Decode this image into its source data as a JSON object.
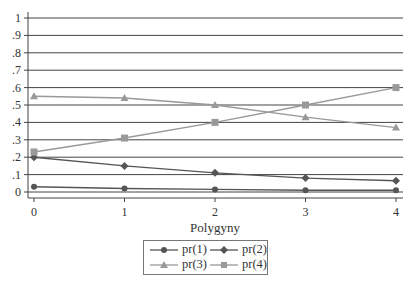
{
  "chart_data": {
    "type": "line",
    "title": "",
    "xlabel": "Polygyny",
    "ylabel": "",
    "x": [
      0,
      1,
      2,
      3,
      4
    ],
    "xticks": [
      "0",
      "1",
      "2",
      "3",
      "4"
    ],
    "yticks": [
      "0",
      ".1",
      ".2",
      ".3",
      ".4",
      ".5",
      ".6",
      ".7",
      ".8",
      ".9",
      "1"
    ],
    "ylim": [
      0,
      1
    ],
    "grid": true,
    "legend_position": "bottom",
    "series": [
      {
        "name": "pr(1)",
        "marker": "circle",
        "color": "#555555",
        "values": [
          0.03,
          0.02,
          0.015,
          0.01,
          0.01
        ]
      },
      {
        "name": "pr(2)",
        "marker": "diamond",
        "color": "#555555",
        "values": [
          0.2,
          0.15,
          0.11,
          0.08,
          0.065
        ]
      },
      {
        "name": "pr(3)",
        "marker": "triangle",
        "color": "#999999",
        "values": [
          0.55,
          0.54,
          0.5,
          0.43,
          0.37
        ]
      },
      {
        "name": "pr(4)",
        "marker": "square",
        "color": "#999999",
        "values": [
          0.23,
          0.31,
          0.4,
          0.5,
          0.6
        ]
      }
    ]
  },
  "legend": {
    "items": [
      "pr(1)",
      "pr(2)",
      "pr(3)",
      "pr(4)"
    ]
  }
}
